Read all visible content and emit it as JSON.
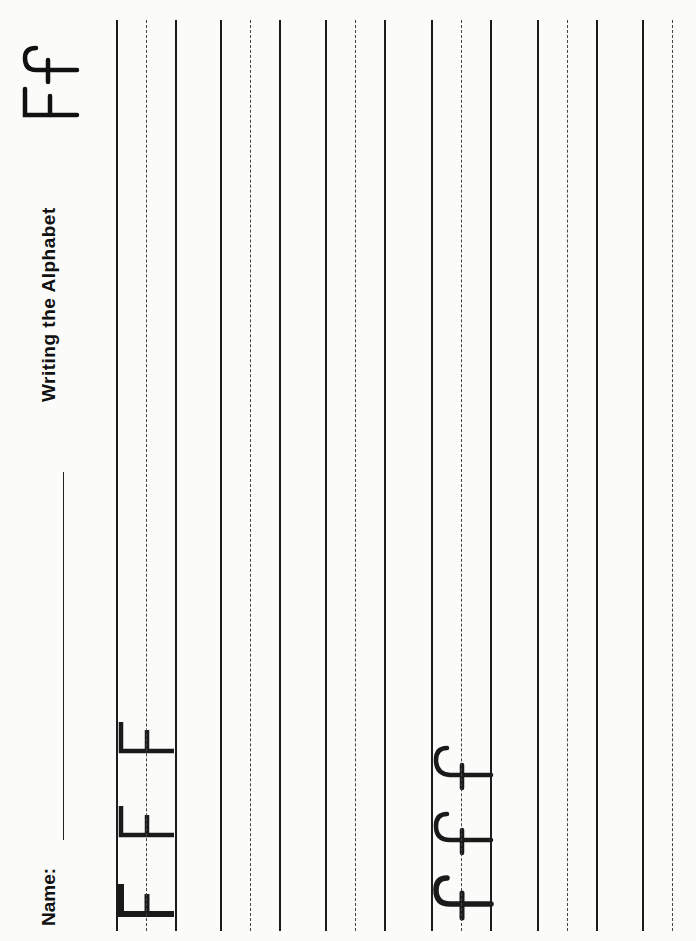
{
  "worksheet": {
    "title": "Writing the Alphabet",
    "letter_header": "Ff",
    "uppercase": "F",
    "lowercase": "f",
    "name_label": "Name:",
    "name_value": ""
  },
  "practice_rows": [
    {
      "row": 1,
      "traced_letter": "F",
      "count": 3
    },
    {
      "row": 2,
      "traced_letter": "",
      "count": 0
    },
    {
      "row": 3,
      "traced_letter": "",
      "count": 0
    },
    {
      "row": 4,
      "traced_letter": "f",
      "count": 3
    },
    {
      "row": 5,
      "traced_letter": "",
      "count": 0
    },
    {
      "row": 6,
      "traced_letter": "",
      "count": 0
    }
  ],
  "colors": {
    "ink": "#111111",
    "paper": "#fbfbfa",
    "guideline": "#1c1c1c",
    "midline": "#444444"
  }
}
